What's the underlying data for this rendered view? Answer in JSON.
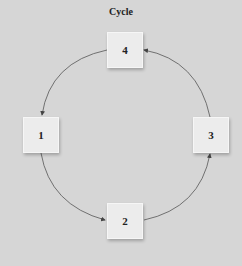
{
  "title": "Cycle",
  "nodes": [
    {
      "id": "1",
      "label": "1",
      "x": 23,
      "y": 117
    },
    {
      "id": "2",
      "label": "2",
      "x": 107,
      "y": 203
    },
    {
      "id": "3",
      "label": "3",
      "x": 193,
      "y": 117
    },
    {
      "id": "4",
      "label": "4",
      "x": 107,
      "y": 32
    }
  ],
  "edges": [
    {
      "from": "4",
      "to": "1"
    },
    {
      "from": "1",
      "to": "2"
    },
    {
      "from": "2",
      "to": "3"
    },
    {
      "from": "3",
      "to": "4"
    }
  ],
  "colors": {
    "background": "#d6d6d6",
    "node_fill": "#ececec",
    "edge": "#444444"
  }
}
